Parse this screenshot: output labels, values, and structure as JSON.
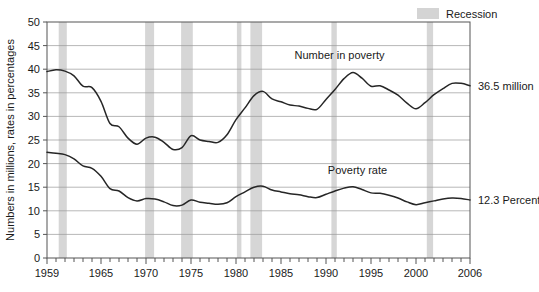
{
  "legend": {
    "position": "top-right",
    "entries": [
      {
        "label": "Recession",
        "swatch_color": "#d4d4d4",
        "type": "band"
      }
    ]
  },
  "axes": {
    "ylabel": "Numbers in millions, rates in percentages",
    "xlabel": "",
    "y_ticks": [
      0,
      5,
      10,
      15,
      20,
      25,
      30,
      35,
      40,
      45,
      50
    ],
    "x_tick_labels": [
      "1959",
      "1965",
      "1970",
      "1975",
      "1980",
      "1985",
      "1990",
      "1995",
      "2000",
      "2006"
    ],
    "x_tick_label_years": [
      1959,
      1965,
      1970,
      1975,
      1980,
      1985,
      1990,
      1995,
      2000,
      2006
    ],
    "xlim": [
      1959,
      2006
    ],
    "ylim": [
      0,
      50
    ],
    "grid": true,
    "grid_color": "#9a9a9a",
    "minor_x_ticks_every": 1
  },
  "annotations": [
    {
      "name": "number-in-poverty-label",
      "text": "Number in poverty",
      "x_year": 1991.5,
      "y_value": 43.0
    },
    {
      "name": "poverty-rate-label",
      "text": "Poverty rate",
      "x_year": 1993.5,
      "y_value": 18.6
    },
    {
      "name": "number-in-poverty-end-label",
      "text": "36.5 million",
      "x_year": 2007.2,
      "y_value": 36.5
    },
    {
      "name": "poverty-rate-end-label",
      "text": "12.3 Percent",
      "x_year": 2007.2,
      "y_value": 12.3
    }
  ],
  "recessions": [
    {
      "start": 1960.3,
      "end": 1961.2
    },
    {
      "start": 1969.9,
      "end": 1970.9
    },
    {
      "start": 1973.9,
      "end": 1975.2
    },
    {
      "start": 1980.1,
      "end": 1980.6
    },
    {
      "start": 1981.6,
      "end": 1982.9
    },
    {
      "start": 1990.6,
      "end": 1991.2
    },
    {
      "start": 2001.2,
      "end": 2001.9
    }
  ],
  "chart_data": {
    "type": "line",
    "title": "",
    "subtitle": "",
    "xlabel": "",
    "ylabel": "Numbers in millions, rates in percentages",
    "xlim": [
      1959,
      2006
    ],
    "ylim": [
      0,
      50
    ],
    "grid": true,
    "legend_position": "top-right",
    "x": [
      1959,
      1960,
      1961,
      1962,
      1963,
      1964,
      1965,
      1966,
      1967,
      1968,
      1969,
      1970,
      1971,
      1972,
      1973,
      1974,
      1975,
      1976,
      1977,
      1978,
      1979,
      1980,
      1981,
      1982,
      1983,
      1984,
      1985,
      1986,
      1987,
      1988,
      1989,
      1990,
      1991,
      1992,
      1993,
      1994,
      1995,
      1996,
      1997,
      1998,
      1999,
      2000,
      2001,
      2002,
      2003,
      2004,
      2005,
      2006
    ],
    "series": [
      {
        "name": "Number in poverty",
        "unit": "millions",
        "end_label": "36.5 million",
        "color": "#262626",
        "values": [
          39.5,
          39.9,
          39.6,
          38.6,
          36.4,
          36.1,
          33.2,
          28.5,
          27.8,
          25.4,
          24.1,
          25.4,
          25.6,
          24.5,
          23.0,
          23.4,
          25.9,
          25.0,
          24.7,
          24.5,
          26.1,
          29.3,
          31.8,
          34.4,
          35.3,
          33.7,
          33.1,
          32.4,
          32.2,
          31.7,
          31.5,
          33.6,
          35.7,
          38.0,
          39.3,
          38.1,
          36.4,
          36.5,
          35.6,
          34.5,
          32.8,
          31.6,
          32.9,
          34.6,
          35.9,
          37.0,
          37.0,
          36.5
        ]
      },
      {
        "name": "Poverty rate",
        "unit": "percent",
        "end_label": "12.3 Percent",
        "color": "#262626",
        "values": [
          22.4,
          22.2,
          21.9,
          21.0,
          19.5,
          19.0,
          17.3,
          14.7,
          14.2,
          12.8,
          12.1,
          12.6,
          12.5,
          11.9,
          11.1,
          11.2,
          12.3,
          11.8,
          11.6,
          11.4,
          11.7,
          13.0,
          14.0,
          15.0,
          15.2,
          14.4,
          14.0,
          13.6,
          13.4,
          13.0,
          12.8,
          13.5,
          14.2,
          14.8,
          15.1,
          14.5,
          13.8,
          13.7,
          13.3,
          12.7,
          11.9,
          11.3,
          11.7,
          12.1,
          12.5,
          12.7,
          12.6,
          12.3
        ]
      }
    ]
  }
}
